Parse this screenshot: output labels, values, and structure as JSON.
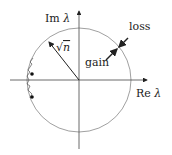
{
  "diagram": {
    "type": "complex-plane-eigenvalue-diagram",
    "axes": {
      "imag_label_prefix": "Im",
      "real_label_prefix": "Re",
      "variable": "λ"
    },
    "circle": {
      "radius_label_symbol": "√",
      "radius_label_var": "n"
    },
    "annotations": {
      "gain": "gain",
      "loss": "loss"
    },
    "outliers": {
      "count": 2,
      "description": "two eigenvalue dots with jagged trajectory near left boundary"
    },
    "colors": {
      "stroke": "#222222",
      "circle": "#888888",
      "background": "#ffffff"
    }
  }
}
